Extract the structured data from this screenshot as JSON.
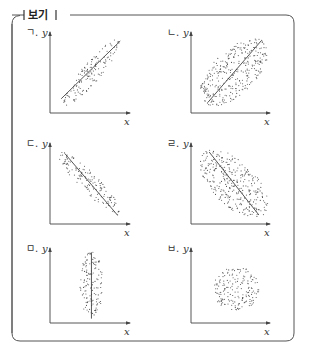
{
  "box": {
    "title": "보기",
    "border_color": "#555555"
  },
  "panels": [
    {
      "label": "ㄱ.",
      "x_label": "x",
      "y_label": "y",
      "correlation": "strong positive",
      "shape": "narrow ellipse",
      "trend_line": "positive"
    },
    {
      "label": "ㄴ.",
      "x_label": "x",
      "y_label": "y",
      "correlation": "weak positive",
      "shape": "wide ellipse",
      "trend_line": "positive"
    },
    {
      "label": "ㄷ.",
      "x_label": "x",
      "y_label": "y",
      "correlation": "strong negative",
      "shape": "narrow ellipse",
      "trend_line": "negative"
    },
    {
      "label": "ㄹ.",
      "x_label": "x",
      "y_label": "y",
      "correlation": "weak negative",
      "shape": "wide ellipse",
      "trend_line": "negative"
    },
    {
      "label": "ㅁ.",
      "x_label": "x",
      "y_label": "y",
      "correlation": "none",
      "shape": "vertical ellipse",
      "trend_line": "vertical"
    },
    {
      "label": "ㅂ.",
      "x_label": "x",
      "y_label": "y",
      "correlation": "none",
      "shape": "circle",
      "trend_line": "none"
    }
  ]
}
